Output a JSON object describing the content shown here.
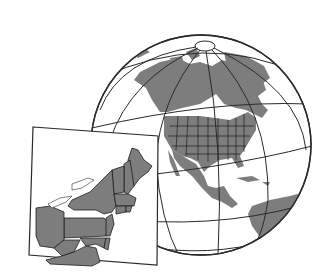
{
  "figure": {
    "colors": {
      "background": "#ffffff",
      "land": "#7d7d7d",
      "outline": "#2a2a2a",
      "border": "#1e1e1e"
    },
    "globe": {
      "cx": 201,
      "cy": 145,
      "r": 110,
      "region": "North America"
    },
    "inset": {
      "region": "Northeastern United States",
      "corners": [
        [
          33,
          127
        ],
        [
          158,
          136
        ],
        [
          157,
          265
        ],
        [
          29,
          255
        ]
      ],
      "states": [
        "Maine",
        "New Hampshire",
        "Vermont",
        "Massachusetts",
        "Rhode Island",
        "Connecticut",
        "New York",
        "New Jersey",
        "Pennsylvania",
        "Delaware",
        "Maryland",
        "Ohio",
        "West Virginia",
        "Virginia"
      ]
    }
  }
}
